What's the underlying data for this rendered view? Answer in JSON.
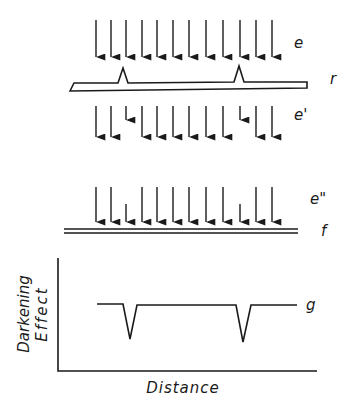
{
  "figure": {
    "type": "schematic"
  },
  "labels": {
    "incident_beam": "e",
    "specimen": "r",
    "transmitted_beam": "e'",
    "beam_at_film": "e\"",
    "film": "f",
    "profile_curve": "g",
    "y_axis_line1": "Darkening",
    "y_axis_line2": "Effect",
    "x_axis": "Distance"
  },
  "colors": {
    "ink": "#1a1a1a",
    "background": "#ffffff"
  },
  "arrows": {
    "x_positions": [
      96,
      111,
      126,
      142,
      157,
      173,
      189,
      206,
      223,
      240,
      256,
      272
    ],
    "row_e": {
      "y_start": 20,
      "y_end": 63,
      "short_indices": []
    },
    "row_e_prime": {
      "y_start": 106,
      "y_end": 143,
      "short_indices": [
        2,
        9
      ],
      "short_end": 126
    },
    "row_e_double_prime": {
      "y_start": 187,
      "y_end": 228,
      "short_indices": [
        2,
        9
      ],
      "short_start": 204
    }
  },
  "chart_data": {
    "type": "line",
    "title": "",
    "xlabel": "Distance",
    "ylabel": "Darkening Effect",
    "series": [
      {
        "name": "g",
        "points": [
          [
            0,
            1.0
          ],
          [
            0.13,
            1.0
          ],
          [
            0.165,
            0.3
          ],
          [
            0.2,
            1.0
          ],
          [
            0.7,
            1.0
          ],
          [
            0.735,
            0.25
          ],
          [
            0.77,
            1.0
          ],
          [
            1.0,
            1.0
          ]
        ]
      }
    ],
    "grid": false,
    "axis_ticks": false
  }
}
